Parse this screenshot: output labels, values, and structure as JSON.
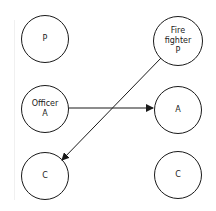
{
  "diagram": {
    "nodes": [
      {
        "id": "p-left",
        "label": "P",
        "cx": 45,
        "cy": 39,
        "r": 24
      },
      {
        "id": "firefighter-p",
        "label": "Fire\nfighter\nP",
        "cx": 178,
        "cy": 41,
        "r": 25
      },
      {
        "id": "officer-a",
        "label": "Officer\nA",
        "cx": 45,
        "cy": 109,
        "r": 24
      },
      {
        "id": "a-right",
        "label": "A",
        "cx": 178,
        "cy": 110,
        "r": 24
      },
      {
        "id": "c-left",
        "label": "C",
        "cx": 45,
        "cy": 176,
        "r": 24
      },
      {
        "id": "c-right",
        "label": "C",
        "cx": 178,
        "cy": 175,
        "r": 24
      }
    ],
    "edges": [
      {
        "from": "officer-a",
        "to": "a-right",
        "x1": 69,
        "y1": 108,
        "x2": 153,
        "y2": 108
      },
      {
        "from": "firefighter-p",
        "to": "c-left",
        "x1": 161,
        "y1": 58,
        "x2": 62,
        "y2": 160
      }
    ],
    "colors": {
      "stroke": "#1a1a1a",
      "background": "#ffffff"
    }
  }
}
